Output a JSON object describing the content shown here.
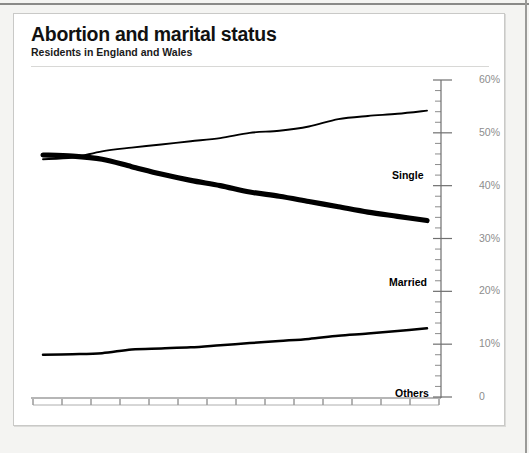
{
  "header": {
    "title": "Abortion and marital status",
    "subtitle": "Residents in England and Wales"
  },
  "colors": {
    "line": "#000000",
    "axis": "#6f6f6f",
    "tick_label": "#8d8d8d",
    "card_background": "#ffffff",
    "page_background": "#f4f4f2",
    "card_border": "#c9c9c7"
  },
  "chart_data": {
    "type": "line",
    "title": "Abortion and marital status",
    "subtitle": "Residents in England and Wales",
    "xlabel": "",
    "ylabel": "",
    "ylim": [
      0,
      60
    ],
    "yticks": [
      0,
      10,
      20,
      30,
      40,
      50,
      60
    ],
    "ytick_labels": [
      "0",
      "10%",
      "20%",
      "30%",
      "40%",
      "50%",
      "60%"
    ],
    "y_axis_position": "right",
    "minor_ticks": true,
    "minor_tick_interval": 2,
    "grid": false,
    "legend_position": "inline-right-of-series",
    "x": [
      1968,
      1969,
      1970,
      1971,
      1972,
      1973,
      1974,
      1975,
      1976,
      1977,
      1978,
      1979,
      1980,
      1981
    ],
    "categories": [
      "1968",
      "1969",
      "1970",
      "1971",
      "1972",
      "1973",
      "1974",
      "1975",
      "1976",
      "1977",
      "1978",
      "1979",
      "1980",
      "1981"
    ],
    "series": [
      {
        "name": "Single",
        "label": "Single",
        "line_width": "thin",
        "values": [
          45.0,
          45.3,
          46.5,
          47.2,
          47.8,
          48.4,
          49.0,
          50.0,
          50.4,
          51.2,
          52.6,
          53.2,
          53.6,
          54.2
        ]
      },
      {
        "name": "Married",
        "label": "Married",
        "line_width": "thick",
        "values": [
          45.8,
          45.6,
          45.0,
          43.6,
          42.2,
          41.0,
          40.0,
          38.8,
          38.0,
          37.0,
          36.0,
          35.0,
          34.2,
          33.4
        ]
      },
      {
        "name": "Others",
        "label": "Others",
        "line_width": "medium",
        "values": [
          8.0,
          8.1,
          8.3,
          9.0,
          9.2,
          9.4,
          9.8,
          10.2,
          10.6,
          11.0,
          11.6,
          12.0,
          12.5,
          13.0
        ]
      }
    ],
    "annotations": [
      "Single and Married series cross between 1969 and 1970"
    ]
  }
}
